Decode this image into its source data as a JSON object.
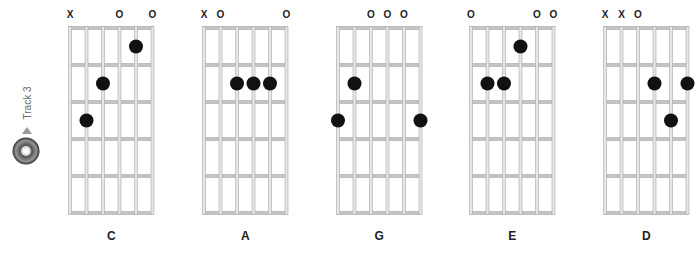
{
  "track": {
    "label": "Track 3",
    "icon": "cd-icon"
  },
  "grid": {
    "strings": 6,
    "frets": 5,
    "string_spacing": 16.5,
    "fret_spacing": 37,
    "top": 28,
    "line_color": "#b8b8b8",
    "dot_color": "#111111"
  },
  "chords": [
    {
      "name": "C",
      "left": 70,
      "markers": [
        "X",
        "",
        "",
        "O",
        "",
        "O"
      ],
      "dots": [
        {
          "string": 5,
          "fret": 1
        },
        {
          "string": 3,
          "fret": 2
        },
        {
          "string": 2,
          "fret": 3
        }
      ]
    },
    {
      "name": "A",
      "left": 204,
      "markers": [
        "X",
        "O",
        "",
        "",
        "",
        "O"
      ],
      "dots": [
        {
          "string": 3,
          "fret": 2
        },
        {
          "string": 4,
          "fret": 2
        },
        {
          "string": 5,
          "fret": 2
        }
      ]
    },
    {
      "name": "G",
      "left": 338,
      "markers": [
        "",
        "",
        "O",
        "O",
        "O",
        ""
      ],
      "dots": [
        {
          "string": 2,
          "fret": 2
        },
        {
          "string": 1,
          "fret": 3
        },
        {
          "string": 6,
          "fret": 3
        }
      ]
    },
    {
      "name": "E",
      "left": 471,
      "markers": [
        "O",
        "",
        "",
        "",
        "O",
        "O"
      ],
      "dots": [
        {
          "string": 4,
          "fret": 1
        },
        {
          "string": 2,
          "fret": 2
        },
        {
          "string": 3,
          "fret": 2
        }
      ]
    },
    {
      "name": "D",
      "left": 605,
      "markers": [
        "X",
        "X",
        "O",
        "",
        "",
        ""
      ],
      "dots": [
        {
          "string": 4,
          "fret": 2
        },
        {
          "string": 6,
          "fret": 2
        },
        {
          "string": 5,
          "fret": 3
        }
      ]
    }
  ]
}
